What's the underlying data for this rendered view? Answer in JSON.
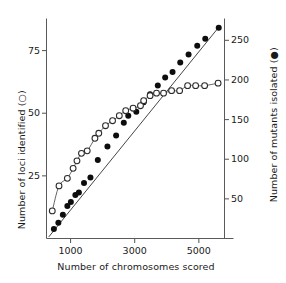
{
  "chart_data": {
    "type": "scatter",
    "title": "",
    "xlabel": "Number of chromosomes scored",
    "ylabel": "Number of loci identified (○)",
    "ylabel_right": "Number of mutants isolated (●)",
    "grid": false,
    "legend": "inline-in-axis-labels",
    "xlim": [
      250,
      5800
    ],
    "xticks": [
      1000,
      3000,
      5000
    ],
    "xtick_labels": [
      "1000",
      "3000",
      "5000"
    ],
    "ylim_left": [
      0,
      87
    ],
    "yticks_left": [
      25,
      50,
      75
    ],
    "ytick_labels_left": [
      "25",
      "50",
      "75"
    ],
    "ylim_right": [
      0,
      275
    ],
    "yticks_right": [
      50,
      100,
      150,
      200,
      250
    ],
    "ytick_labels_right": [
      "50",
      "100",
      "150",
      "200",
      "250"
    ],
    "series": [
      {
        "name": "Number of mutants isolated",
        "marker": "filled-circle",
        "axis": "right",
        "color": "#0d0d0d",
        "fit": "linear",
        "fit_points": [
          [
            320,
            2
          ],
          [
            5650,
            268
          ]
        ],
        "points": [
          [
            480,
            12
          ],
          [
            620,
            20
          ],
          [
            760,
            30
          ],
          [
            900,
            41
          ],
          [
            1010,
            46
          ],
          [
            1150,
            55
          ],
          [
            1260,
            58
          ],
          [
            1420,
            70
          ],
          [
            1620,
            77
          ],
          [
            1850,
            99
          ],
          [
            2150,
            116
          ],
          [
            2420,
            130
          ],
          [
            2660,
            146
          ],
          [
            2800,
            155
          ],
          [
            3050,
            160
          ],
          [
            3280,
            172
          ],
          [
            3480,
            182
          ],
          [
            3720,
            193
          ],
          [
            3950,
            203
          ],
          [
            4180,
            210
          ],
          [
            4420,
            222
          ],
          [
            4680,
            232
          ],
          [
            4950,
            243
          ],
          [
            5200,
            252
          ],
          [
            5620,
            266
          ]
        ]
      },
      {
        "name": "Number of loci identified",
        "marker": "open-circle",
        "axis": "left",
        "color": "#2b2b2b",
        "fit": "smooth-saturating",
        "points": [
          [
            430,
            11
          ],
          [
            640,
            21
          ],
          [
            900,
            24
          ],
          [
            1080,
            28
          ],
          [
            1200,
            31
          ],
          [
            1340,
            34
          ],
          [
            1520,
            35
          ],
          [
            1760,
            40
          ],
          [
            1880,
            42
          ],
          [
            2090,
            45
          ],
          [
            2310,
            47
          ],
          [
            2520,
            49
          ],
          [
            2720,
            51
          ],
          [
            2950,
            52
          ],
          [
            3180,
            53
          ],
          [
            3280,
            55
          ],
          [
            3480,
            57
          ],
          [
            3680,
            58
          ],
          [
            3900,
            58
          ],
          [
            4150,
            59
          ],
          [
            4400,
            59
          ],
          [
            4650,
            61
          ],
          [
            4900,
            61
          ],
          [
            5180,
            61
          ],
          [
            5600,
            62
          ]
        ]
      }
    ]
  },
  "axes": {
    "left_title": "Number of loci identified (○)",
    "right_title": "Number of mutants isolated (●)",
    "bottom_title": "Number of chromosomes scored"
  }
}
